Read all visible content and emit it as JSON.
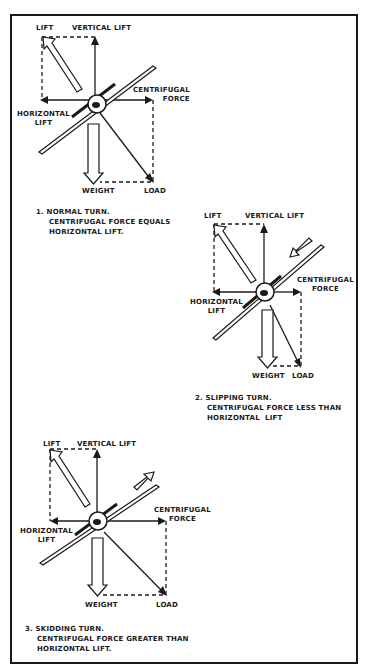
{
  "diagrams": [
    {
      "id": "normal",
      "labels": {
        "lift": "LIFT",
        "vertical_lift": "VERTICAL LIFT",
        "centrifugal_force": "CENTRIFUGAL\nFORCE",
        "horizontal_lift": "HORIZONTAL\nLIFT",
        "weight": "WEIGHT",
        "load": "LOAD"
      },
      "caption": {
        "number": "1.",
        "title": "NORMAL TURN.",
        "line2": "CENTRIFUGAL FORCE EQUALS",
        "line3": "HORIZONTAL LIFT."
      }
    },
    {
      "id": "slipping",
      "labels": {
        "lift": "LIFT",
        "vertical_lift": "VERTICAL LIFT",
        "centrifugal_force": "CENTRIFUGAL\nFORCE",
        "horizontal_lift": "HORIZONTAL\nLIFT",
        "weight": "WEIGHT",
        "load": "LOAD"
      },
      "caption": {
        "number": "2.",
        "title": "SLIPPING TURN.",
        "line2": "CENTRIFUGAL FORCE LESS THAN",
        "line3": "HORIZONTAL  LIFT"
      }
    },
    {
      "id": "skidding",
      "labels": {
        "lift": "LIFT",
        "vertical_lift": "VERTICAL LIFT",
        "centrifugal_force": "CENTRIFUGAL\nFORCE",
        "horizontal_lift": "HORIZONTAL\nLIFT",
        "weight": "WEIGHT",
        "load": "LOAD"
      },
      "caption": {
        "number": "3.",
        "title": "SKIDDING TURN.",
        "line2": "CENTRIFUGAL FORCE GREATER THAN",
        "line3": "HORIZONTAL LIFT."
      }
    }
  ]
}
